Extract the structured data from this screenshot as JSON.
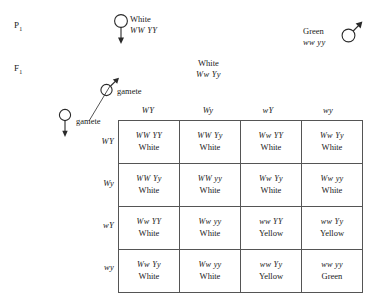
{
  "generations": {
    "parental_label": "P",
    "parental_subscript": "1",
    "f1_label": "F",
    "f1_subscript": "1"
  },
  "parents": {
    "female": {
      "symbol": "female-symbol",
      "phenotype": "White",
      "genotype": "WW YY"
    },
    "male": {
      "symbol": "male-symbol",
      "phenotype": "Green",
      "genotype": "ww yy"
    }
  },
  "f1_offspring": {
    "phenotype": "White",
    "genotype": "Ww Yy"
  },
  "gametes": {
    "male_label": "gamete",
    "female_label": "gamete",
    "male_symbol": "male-symbol",
    "female_symbol": "female-symbol",
    "columns": [
      "WY",
      "Wy",
      "wY",
      "wy"
    ],
    "rows": [
      "WY",
      "Wy",
      "wY",
      "wy"
    ]
  },
  "punnett": {
    "cells": [
      [
        {
          "genotype": "WW YY",
          "phenotype": "White"
        },
        {
          "genotype": "WW Yy",
          "phenotype": "White"
        },
        {
          "genotype": "Ww YY",
          "phenotype": "White"
        },
        {
          "genotype": "Ww Yy",
          "phenotype": "White"
        }
      ],
      [
        {
          "genotype": "WW Yy",
          "phenotype": "White"
        },
        {
          "genotype": "WW yy",
          "phenotype": "White"
        },
        {
          "genotype": "Ww Yy",
          "phenotype": "White"
        },
        {
          "genotype": "Ww yy",
          "phenotype": "White"
        }
      ],
      [
        {
          "genotype": "Ww YY",
          "phenotype": "White"
        },
        {
          "genotype": "Ww yy",
          "phenotype": "White"
        },
        {
          "genotype": "ww YY",
          "phenotype": "Yellow"
        },
        {
          "genotype": "ww Yy",
          "phenotype": "Yellow"
        }
      ],
      [
        {
          "genotype": "Ww Yy",
          "phenotype": "White"
        },
        {
          "genotype": "Ww yy",
          "phenotype": "White"
        },
        {
          "genotype": "ww Yy",
          "phenotype": "Yellow"
        },
        {
          "genotype": "ww yy",
          "phenotype": "Green"
        }
      ]
    ]
  },
  "colors": {
    "ink": "#1a1a1a",
    "grid_line": "#555555",
    "background": "#ffffff"
  }
}
